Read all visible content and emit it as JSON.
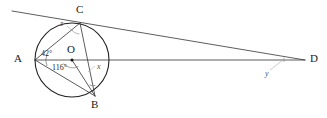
{
  "figure": {
    "type": "circle-geometry-diagram",
    "stroke_color": "#222222",
    "light_stroke_color": "#888888",
    "background": "#ffffff",
    "width": 327,
    "height": 118
  },
  "circle": {
    "center_label": "O",
    "center_x": 72,
    "center_y": 60,
    "radius": 37
  },
  "points": [
    {
      "label": "A",
      "x": 35,
      "y": 60,
      "label_x": 14,
      "label_y": 53
    },
    {
      "label": "C",
      "x": 80,
      "y": 23,
      "label_x": 76,
      "label_y": 5
    },
    {
      "label": "B",
      "x": 95,
      "y": 96,
      "label_x": 91,
      "label_y": 100
    },
    {
      "label": "D",
      "x": 305,
      "y": 60,
      "label_x": 310,
      "label_y": 53
    },
    {
      "label": "O",
      "x": 72,
      "y": 60,
      "label_x": 68,
      "label_y": 44
    }
  ],
  "segments": [
    {
      "name": "A-C",
      "from": "A",
      "to": "C"
    },
    {
      "name": "A-B",
      "from": "A",
      "to": "B"
    },
    {
      "name": "C-B",
      "from": "C",
      "to": "B"
    },
    {
      "name": "O-B",
      "from": "O",
      "to": "B"
    },
    {
      "name": "A-D",
      "from": "A",
      "to": "D"
    },
    {
      "name": "C-D",
      "from": "C",
      "to": "D"
    }
  ],
  "tangent": {
    "name": "tangent-at-C",
    "x1": 12,
    "y1": 11,
    "x2": 305,
    "y2": 60
  },
  "angles": [
    {
      "name": "angle-at-A",
      "value": "42°",
      "label_x": 41,
      "label_y": 50,
      "vertex": "A"
    },
    {
      "name": "angle-at-O",
      "value": "116°",
      "label_x": 53,
      "label_y": 63,
      "vertex": "O"
    },
    {
      "name": "angle-x-at-B",
      "value": "x",
      "label_x": 95,
      "label_y": 65,
      "vertex": "B"
    },
    {
      "name": "angle-y-at-D",
      "value": "y",
      "label_x": 265,
      "label_y": 70,
      "vertex": "D"
    },
    {
      "name": "angle-z-at-C",
      "value": "z",
      "label_x": 62,
      "label_y": 22,
      "vertex": "C"
    }
  ]
}
